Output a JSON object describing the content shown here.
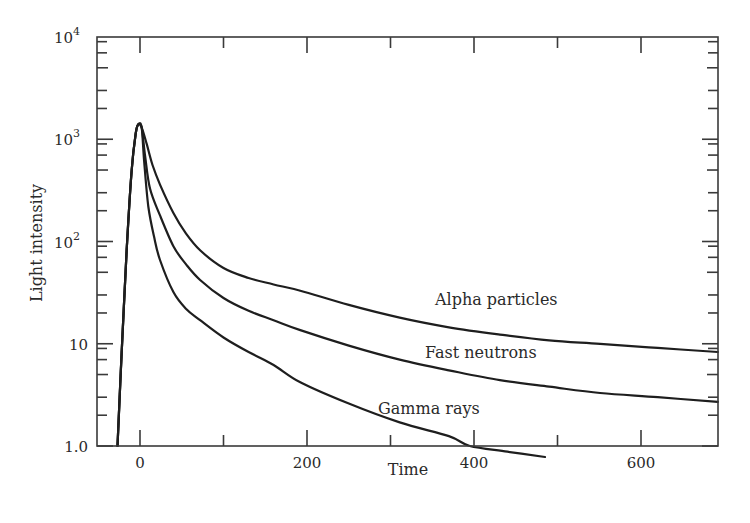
{
  "chart_data": {
    "type": "line",
    "title": "",
    "xlabel": "Time",
    "ylabel": "Light intensity",
    "yscale": "log",
    "xlim": [
      -50,
      692
    ],
    "ylim": [
      1.0,
      10000
    ],
    "grid": false,
    "legend": "inline labels",
    "x_ticks": [
      {
        "value": 0,
        "label": "0"
      },
      {
        "value": 100,
        "label": ""
      },
      {
        "value": 200,
        "label": "200"
      },
      {
        "value": 300,
        "label": ""
      },
      {
        "value": 400,
        "label": "400"
      },
      {
        "value": 500,
        "label": ""
      },
      {
        "value": 600,
        "label": "600"
      }
    ],
    "y_ticks": [
      {
        "value": 1,
        "label": "1.0"
      },
      {
        "value": 10,
        "label": "10"
      },
      {
        "value": 100,
        "label": "10",
        "exp": "2"
      },
      {
        "value": 1000,
        "label": "10",
        "exp": "3"
      },
      {
        "value": 10000,
        "label": "10",
        "exp": "4"
      }
    ],
    "series": [
      {
        "name": "Alpha particles",
        "label_pos": {
          "x": 435,
          "y": 305
        },
        "points": [
          [
            -27,
            1.0
          ],
          [
            -22,
            8
          ],
          [
            -16,
            80
          ],
          [
            -10,
            500
          ],
          [
            -5,
            1150
          ],
          [
            -2,
            1400
          ],
          [
            2,
            1300
          ],
          [
            8,
            900
          ],
          [
            15,
            560
          ],
          [
            24,
            360
          ],
          [
            40,
            190
          ],
          [
            55,
            120
          ],
          [
            72,
            82
          ],
          [
            100,
            55
          ],
          [
            130,
            44
          ],
          [
            160,
            38
          ],
          [
            192,
            33
          ],
          [
            250,
            24
          ],
          [
            311,
            18
          ],
          [
            370,
            14.5
          ],
          [
            431,
            12.3
          ],
          [
            490,
            10.8
          ],
          [
            551,
            10
          ],
          [
            620,
            9.1
          ],
          [
            692,
            8.3
          ]
        ]
      },
      {
        "name": "Fast neutrons",
        "label_pos": {
          "x": 425,
          "y": 358
        },
        "points": [
          [
            -27,
            1.0
          ],
          [
            -22,
            8
          ],
          [
            -16,
            80
          ],
          [
            -10,
            500
          ],
          [
            -5,
            1150
          ],
          [
            -2,
            1400
          ],
          [
            2,
            1300
          ],
          [
            6,
            700
          ],
          [
            12,
            330
          ],
          [
            24,
            180
          ],
          [
            40,
            90
          ],
          [
            55,
            60
          ],
          [
            72,
            42
          ],
          [
            100,
            28
          ],
          [
            130,
            21
          ],
          [
            160,
            17
          ],
          [
            192,
            13.6
          ],
          [
            250,
            9.6
          ],
          [
            311,
            7
          ],
          [
            370,
            5.5
          ],
          [
            431,
            4.4
          ],
          [
            490,
            3.8
          ],
          [
            551,
            3.3
          ],
          [
            620,
            3.0
          ],
          [
            692,
            2.7
          ]
        ]
      },
      {
        "name": "Gamma rays",
        "label_pos": {
          "x": 378,
          "y": 414
        },
        "points": [
          [
            -27,
            1.0
          ],
          [
            -22,
            8
          ],
          [
            -16,
            80
          ],
          [
            -10,
            500
          ],
          [
            -5,
            1150
          ],
          [
            -2,
            1400
          ],
          [
            2,
            1300
          ],
          [
            5,
            600
          ],
          [
            10,
            220
          ],
          [
            17,
            110
          ],
          [
            24,
            66
          ],
          [
            40,
            32
          ],
          [
            55,
            22
          ],
          [
            72,
            17
          ],
          [
            100,
            11.5
          ],
          [
            130,
            8.3
          ],
          [
            160,
            6.2
          ],
          [
            192,
            4.2
          ],
          [
            250,
            2.6
          ],
          [
            311,
            1.7
          ],
          [
            370,
            1.25
          ],
          [
            395,
            1.0
          ],
          [
            440,
            0.88
          ],
          [
            485,
            0.78
          ]
        ]
      }
    ]
  }
}
